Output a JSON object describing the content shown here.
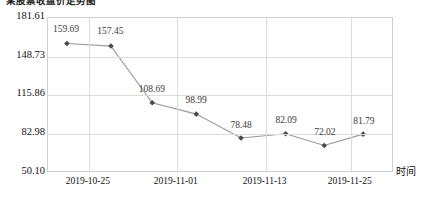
{
  "title": "某股票收盘价走势图",
  "axis": {
    "x_title": "时间",
    "y_ticks": [
      "181.61",
      "148.73",
      "115.86",
      "82.98",
      "50.10"
    ],
    "x_ticks": [
      "2019-10-25",
      "2019-11-01",
      "2019-11-13",
      "2019-11-25"
    ]
  },
  "style": {
    "line_color": "#9a9a9a",
    "marker_color": "#4a4a4a",
    "grid_color": "#dcdcdc",
    "plot_border_color": "#d0d0d0",
    "text_color": "#111111",
    "label_color": "#3b3b3b",
    "background": "#ffffff"
  },
  "chart_data": {
    "type": "line",
    "title": "某股票收盘价走势图",
    "xlabel": "时间",
    "ylabel": "",
    "ylim": [
      50.1,
      181.61
    ],
    "y_ticks": [
      50.1,
      82.98,
      115.86,
      148.73,
      181.61
    ],
    "x_tick_labels": [
      "2019-10-25",
      "2019-11-01",
      "2019-11-13",
      "2019-11-25"
    ],
    "x_tick_positions": [
      0.118,
      0.372,
      0.629,
      0.875
    ],
    "grid": true,
    "legend": false,
    "categories": [
      "1",
      "2",
      "3",
      "4",
      "5",
      "6",
      "7",
      "8"
    ],
    "values": [
      159.69,
      157.45,
      108.69,
      98.99,
      78.48,
      82.09,
      72.02,
      81.79
    ],
    "point_x_fraction": [
      0.055,
      0.183,
      0.303,
      0.431,
      0.561,
      0.691,
      0.803,
      0.916
    ],
    "data_labels": [
      "159.69",
      "157.45",
      "108.69",
      "98.99",
      "78.48",
      "82.09",
      "72.02",
      "81.79"
    ],
    "series": [
      {
        "name": "收盘价",
        "values": [
          159.69,
          157.45,
          108.69,
          98.99,
          78.48,
          82.09,
          72.02,
          81.79
        ]
      }
    ]
  }
}
